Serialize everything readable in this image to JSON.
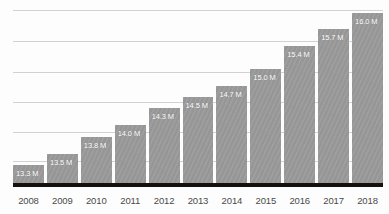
{
  "chart_data": {
    "type": "bar",
    "title": "",
    "subtitle": "",
    "xlabel": "",
    "ylabel": "",
    "categories": [
      "2008",
      "2009",
      "2010",
      "2011",
      "2012",
      "2013",
      "2014",
      "2015",
      "2016",
      "2017",
      "2018"
    ],
    "values": [
      13.3,
      13.5,
      13.8,
      14.0,
      14.3,
      14.5,
      14.7,
      15.0,
      15.4,
      15.7,
      16.0
    ],
    "data_labels": [
      "13.3 M",
      "13.5 M",
      "13.8 M",
      "14.0 M",
      "14.3 M",
      "14.5 M",
      "14.7 M",
      "15.0 M",
      "15.4 M",
      "15.7 M",
      "16.0 M"
    ],
    "unit": "M",
    "ylim": [
      12.98,
      16.08
    ],
    "grid": true,
    "gridline_count": 6,
    "gridline_values": [
      16.05,
      15.49,
      14.95,
      14.41,
      13.89,
      13.37
    ],
    "legend": null,
    "legend_position": "none",
    "colors": {
      "bar": "#9b9b9b",
      "gridline": "#d2d2d2",
      "baseline": "#14110f",
      "data_label": "#ffffff",
      "tick_label": "#4a4a4a",
      "background": "#fdfdfd"
    }
  }
}
